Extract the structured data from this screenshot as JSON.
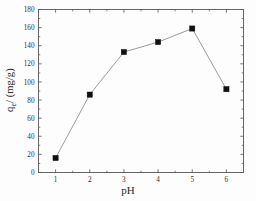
{
  "chart_data": {
    "type": "line",
    "title": "",
    "xlabel": "pH",
    "ylabel": "q_e/(mg/g)",
    "ylabel_main": "q",
    "ylabel_sub": "e",
    "ylabel_rest": "/ (mg/g)",
    "x": [
      1,
      2,
      3,
      4,
      5,
      6
    ],
    "values": [
      16,
      86,
      133,
      144,
      159,
      92
    ],
    "series": [
      {
        "name": "qe",
        "values": [
          16,
          86,
          133,
          144,
          159,
          92
        ],
        "marker": "filled-square",
        "marker_color": "#111111",
        "line_color": "#8a8a8a"
      }
    ],
    "xlim": [
      0.5,
      6.5
    ],
    "ylim": [
      0,
      180
    ],
    "xticks": [
      1,
      2,
      3,
      4,
      5,
      6
    ],
    "xtick_labels": [
      "1",
      "2",
      "3",
      "4",
      "5",
      "6"
    ],
    "yticks": [
      0,
      20,
      40,
      60,
      80,
      100,
      120,
      140,
      160,
      180
    ],
    "ytick_labels": [
      "0",
      "20",
      "40",
      "60",
      "80",
      "100",
      "120",
      "140",
      "160",
      "180"
    ],
    "grid": false,
    "legend": null,
    "frame": true,
    "minor_ticks": true
  },
  "figure": {
    "background_color": "#fdfdfd",
    "axis_color": "#555555",
    "text_color": "#2a2a2a"
  }
}
